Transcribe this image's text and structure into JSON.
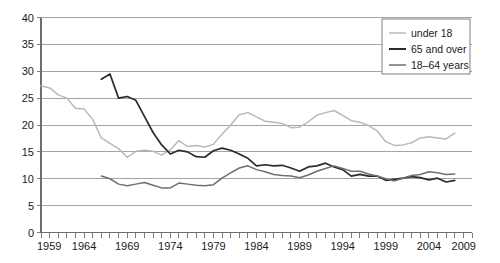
{
  "chart_data": {
    "type": "line",
    "title": "",
    "subtitle": "",
    "xlabel": "",
    "ylabel": "",
    "xlim": [
      1959,
      2009
    ],
    "ylim": [
      0,
      40
    ],
    "ytick_step": 5,
    "xtick_step": 1,
    "xlabel_step": 5,
    "grid": true,
    "legend_position": "top-right",
    "yticks": [
      "0",
      "5",
      "10",
      "15",
      "20",
      "25",
      "30",
      "35",
      "40"
    ],
    "xticks": [
      "1959",
      "1964",
      "1969",
      "1974",
      "1979",
      "1984",
      "1989",
      "1994",
      "1999",
      "2004",
      "2009"
    ],
    "legend": [
      {
        "label": "under 18",
        "color": "#b9b9b9"
      },
      {
        "label": "65 and over",
        "color": "#2b2b2b"
      },
      {
        "label": "18–64 years",
        "color": "#6f6f6f"
      }
    ],
    "series": [
      {
        "name": "under 18",
        "color": "#b9b9b9",
        "width": 1.5,
        "x": [
          1959,
          1960,
          1961,
          1962,
          1963,
          1964,
          1965,
          1966,
          1967,
          1968,
          1969,
          1970,
          1971,
          1972,
          1973,
          1974,
          1975,
          1976,
          1977,
          1978,
          1979,
          1980,
          1981,
          1982,
          1983,
          1984,
          1985,
          1986,
          1987,
          1988,
          1989,
          1990,
          1991,
          1992,
          1993,
          1994,
          1995,
          1996,
          1997,
          1998,
          1999,
          2000,
          2001,
          2002,
          2003,
          2004,
          2005,
          2006,
          2007
        ],
        "values": [
          27.3,
          26.9,
          25.6,
          25.0,
          23.1,
          23.0,
          21.0,
          17.6,
          16.6,
          15.6,
          14.0,
          15.1,
          15.3,
          15.1,
          14.4,
          15.4,
          17.1,
          16.0,
          16.2,
          15.9,
          16.4,
          18.3,
          20.0,
          21.9,
          22.3,
          21.5,
          20.7,
          20.5,
          20.3,
          19.5,
          19.6,
          20.6,
          21.8,
          22.3,
          22.7,
          21.8,
          20.8,
          20.5,
          19.9,
          18.9,
          16.9,
          16.2,
          16.3,
          16.7,
          17.6,
          17.8,
          17.6,
          17.4,
          18.5
        ]
      },
      {
        "name": "65 and over",
        "color": "#2b2b2b",
        "width": 1.7,
        "x": [
          1966,
          1967,
          1968,
          1969,
          1970,
          1971,
          1972,
          1973,
          1974,
          1975,
          1976,
          1977,
          1978,
          1979,
          1980,
          1981,
          1982,
          1983,
          1984,
          1985,
          1986,
          1987,
          1988,
          1989,
          1990,
          1991,
          1992,
          1993,
          1994,
          1995,
          1996,
          1997,
          1998,
          1999,
          2000,
          2001,
          2002,
          2003,
          2004,
          2005,
          2006,
          2007
        ],
        "values": [
          28.5,
          29.5,
          25.0,
          25.3,
          24.6,
          21.6,
          18.6,
          16.3,
          14.6,
          15.3,
          15.0,
          14.1,
          14.0,
          15.2,
          15.7,
          15.3,
          14.6,
          13.8,
          12.4,
          12.6,
          12.4,
          12.5,
          12.0,
          11.4,
          12.2,
          12.4,
          12.9,
          12.2,
          11.7,
          10.5,
          10.8,
          10.5,
          10.5,
          9.7,
          9.9,
          10.1,
          10.4,
          10.2,
          9.8,
          10.1,
          9.4,
          9.7
        ]
      },
      {
        "name": "18–64 years",
        "color": "#6f6f6f",
        "width": 1.5,
        "x": [
          1966,
          1967,
          1968,
          1969,
          1970,
          1971,
          1972,
          1973,
          1974,
          1975,
          1976,
          1977,
          1978,
          1979,
          1980,
          1981,
          1982,
          1983,
          1984,
          1985,
          1986,
          1987,
          1988,
          1989,
          1990,
          1991,
          1992,
          1993,
          1994,
          1995,
          1996,
          1997,
          1998,
          1999,
          2000,
          2001,
          2002,
          2003,
          2004,
          2005,
          2006,
          2007
        ],
        "values": [
          10.5,
          10.0,
          9.0,
          8.7,
          9.0,
          9.3,
          8.8,
          8.3,
          8.3,
          9.2,
          9.0,
          8.8,
          8.7,
          8.9,
          10.1,
          11.1,
          12.0,
          12.4,
          11.7,
          11.3,
          10.8,
          10.6,
          10.5,
          10.2,
          10.7,
          11.4,
          11.9,
          12.4,
          11.9,
          11.4,
          11.4,
          10.9,
          10.5,
          10.0,
          9.6,
          10.1,
          10.6,
          10.8,
          11.3,
          11.1,
          10.8,
          10.9
        ]
      }
    ]
  }
}
